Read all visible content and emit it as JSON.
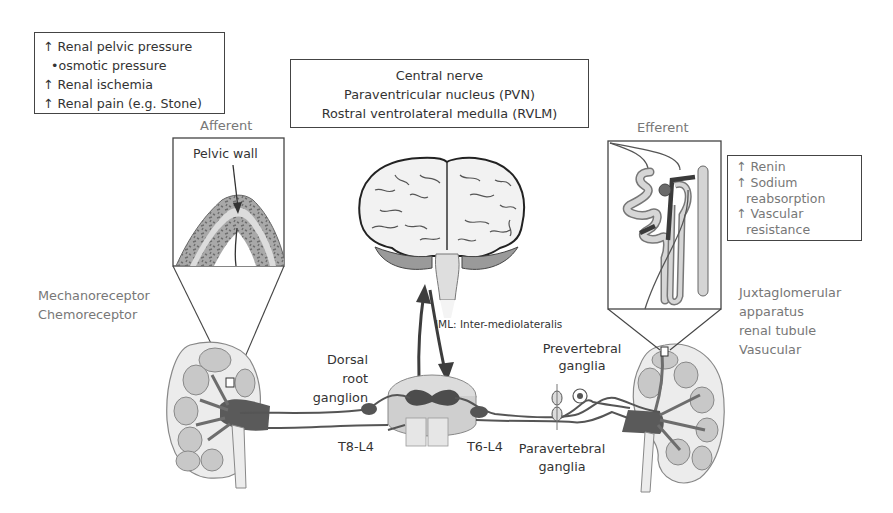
{
  "afferent_stimuli_box": {
    "lines": [
      "↑ Renal pelvic pressure",
      "  •osmotic pressure",
      "↑ Renal ischemia",
      "↑ Renal pain (e.g. Stone)"
    ]
  },
  "central_box": {
    "lines": [
      "Central nerve",
      "Paraventricular nucleus (PVN)",
      "Rostral ventrolateral medulla (RVLM)"
    ]
  },
  "efferent_effects_box": {
    "lines": [
      "↑ Renin",
      "↑ Sodium",
      "  reabsorption",
      "↑ Vascular",
      "  resistance"
    ]
  },
  "labels": {
    "afferent": "Afferent",
    "efferent": "Efferent",
    "pelvic_wall": "Pelvic wall",
    "receptors": [
      "Mechanoreceptor",
      "Chemoreceptor"
    ],
    "juxtaglomerular": [
      "Juxtaglomerular",
      "apparatus",
      "renal tubule",
      "Vasucular"
    ],
    "iml": "IML: Inter-mediolateralis",
    "dorsal_root_ganglion": [
      "Dorsal",
      "root",
      "ganglion"
    ],
    "prevertebral_ganglia": [
      "Prevertebral",
      "ganglia"
    ],
    "paravertebral_ganglia": [
      "Paravertebral",
      "ganglia"
    ],
    "t8_l4": "T8-L4",
    "t6_l4": "T6-L4"
  },
  "colors": {
    "outline": "#444444",
    "nerve": "#555555",
    "tissue_light": "#d9d9d9",
    "tissue_mid": "#a8a8a8",
    "grey_text": "#777777"
  }
}
